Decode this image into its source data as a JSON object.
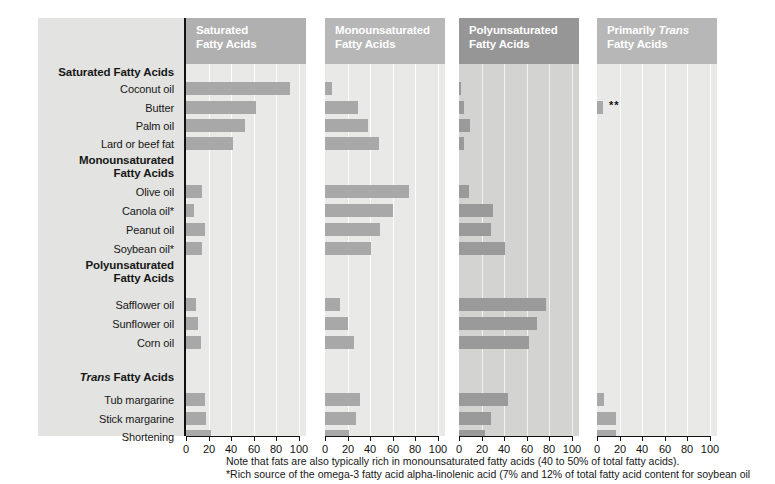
{
  "chart_data": {
    "type": "bar",
    "xlabel": "",
    "ylabel": "",
    "xlim": [
      0,
      100
    ],
    "xticks": [
      0,
      20,
      40,
      60,
      80,
      100
    ],
    "grid": true,
    "legend_position": "none",
    "orientation": "horizontal",
    "categories": [
      "Coconut oil",
      "Butter",
      "Palm oil",
      "Lard or beef fat",
      "Olive oil",
      "Canola oil*",
      "Peanut oil",
      "Soybean oil*",
      "Safflower oil",
      "Sunflower oil",
      "Corn oil",
      "Tub margarine",
      "Stick margarine",
      "Shortening"
    ],
    "series": [
      {
        "name": "Saturated Fatty Acids",
        "values": [
          92,
          62,
          52,
          42,
          14,
          7,
          17,
          14,
          9,
          11,
          13,
          17,
          18,
          22
        ]
      },
      {
        "name": "Monounsaturated Fatty Acids",
        "values": [
          6,
          29,
          38,
          48,
          74,
          60,
          49,
          41,
          13,
          20,
          26,
          31,
          27,
          21
        ]
      },
      {
        "name": "Polyunsaturated Fatty Acids",
        "values": [
          2,
          4,
          10,
          4,
          9,
          30,
          28,
          41,
          77,
          69,
          62,
          43,
          28,
          23
        ]
      },
      {
        "name": "Primarily Trans Fatty Acids",
        "values": [
          0,
          5,
          0,
          0,
          0,
          0,
          0,
          0,
          0,
          0,
          0,
          6,
          17,
          17
        ]
      }
    ]
  },
  "panels": [
    {
      "title_line1": "Saturated",
      "title_line2": "Fatty Acids",
      "title_italic_word": "",
      "header_color": "#b0b0b0",
      "plot_color": "#e9e9e7",
      "bar_color": "#a8a8a8",
      "series_index": 0
    },
    {
      "title_line1": "Monounsaturated",
      "title_line2": "Fatty Acids",
      "title_italic_word": "",
      "header_color": "#b7b7b7",
      "plot_color": "#e9e9e7",
      "bar_color": "#a8a8a8",
      "series_index": 1
    },
    {
      "title_line1": "Polyunsaturated",
      "title_line2": "Fatty Acids",
      "title_italic_word": "",
      "header_color": "#969696",
      "plot_color": "#d3d3d1",
      "bar_color": "#9a9a9a",
      "series_index": 2
    },
    {
      "title_line1": "Primarily ",
      "title_line2": "Fatty Acids",
      "title_italic_word": "Trans",
      "header_color": "#b7b7b7",
      "plot_color": "#e9e9e7",
      "bar_color": "#a8a8a8",
      "series_index": 3
    }
  ],
  "row_labels": [
    {
      "text": "Saturated Fatty Acids",
      "type": "group"
    },
    {
      "text": "Coconut oil",
      "type": "item"
    },
    {
      "text": "Butter",
      "type": "item"
    },
    {
      "text": "Palm oil",
      "type": "item"
    },
    {
      "text": "Lard or beef fat",
      "type": "item"
    },
    {
      "text": "Monounsaturated",
      "text2": "Fatty Acids",
      "type": "group2"
    },
    {
      "text": "Olive oil",
      "type": "item"
    },
    {
      "text": "Canola oil*",
      "type": "item"
    },
    {
      "text": "Peanut oil",
      "type": "item"
    },
    {
      "text": "Soybean oil*",
      "type": "item"
    },
    {
      "text": "Polyunsaturated",
      "text2": "Fatty Acids",
      "type": "group2"
    },
    {
      "text": "Safflower oil",
      "type": "item"
    },
    {
      "text": "Sunflower oil",
      "type": "item"
    },
    {
      "text": "Corn oil",
      "type": "item"
    },
    {
      "text": "Trans Fatty Acids",
      "italic_lead": "Trans",
      "rest": " Fatty Acids",
      "type": "group-italic"
    },
    {
      "text": "Tub margarine",
      "type": "item"
    },
    {
      "text": "Stick margarine",
      "type": "item"
    },
    {
      "text": "Shortening",
      "type": "item"
    }
  ],
  "axis": {
    "tick_labels": [
      "0",
      "20",
      "40",
      "60",
      "80",
      "100"
    ]
  },
  "markers": {
    "butter_trans_stars": "**"
  },
  "footnotes": {
    "line1": "Note that fats are also typically rich in monounsaturated fatty acids (40 to 50% of total fatty acids).",
    "line2": "*Rich source of the omega-3 fatty acid alpha-linolenic acid (7% and 12% of total fatty acid content for soybean oil"
  }
}
